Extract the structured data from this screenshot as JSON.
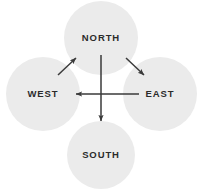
{
  "diagram": {
    "background_color": "#ffffff",
    "node_fill_color": "#ebebeb",
    "node_text_color": "#2b2b2b",
    "arrow_color": "#3a3a3a",
    "nodes": [
      {
        "id": "north",
        "label": "NORTH",
        "cx": 101,
        "cy": 38,
        "r": 37
      },
      {
        "id": "west",
        "label": "WEST",
        "cx": 43,
        "cy": 94,
        "r": 37
      },
      {
        "id": "east",
        "label": "EAST",
        "cx": 160,
        "cy": 94,
        "r": 37
      },
      {
        "id": "south",
        "label": "SOUTH",
        "cx": 101,
        "cy": 155,
        "r": 34
      }
    ],
    "arrows": [
      {
        "id": "north-to-south",
        "from": "north",
        "to": "south",
        "x1": 101,
        "y1": 55,
        "x2": 101,
        "y2": 121
      },
      {
        "id": "east-to-west",
        "from": "east",
        "to": "west",
        "x1": 139,
        "y1": 94,
        "x2": 76,
        "y2": 94
      },
      {
        "id": "west-to-north",
        "from": "west",
        "to": "north",
        "x1": 58,
        "y1": 75,
        "x2": 76,
        "y2": 58
      },
      {
        "id": "north-to-east",
        "from": "north",
        "to": "east",
        "x1": 126,
        "y1": 58,
        "x2": 144,
        "y2": 75
      }
    ]
  }
}
